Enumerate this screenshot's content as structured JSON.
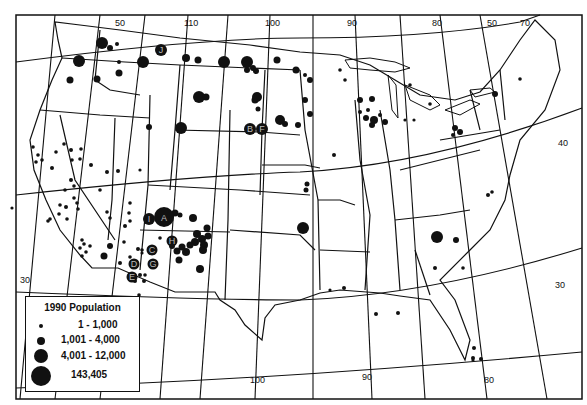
{
  "map": {
    "title": "",
    "graticule_labels": {
      "top": [
        "50",
        "110",
        "100",
        "90",
        "80",
        "50",
        "70"
      ],
      "bottom": [
        "100",
        "90",
        "80"
      ],
      "left": [
        "30"
      ],
      "right": [
        "40",
        "30"
      ]
    },
    "lat_lines": [
      "50",
      "40",
      "30"
    ],
    "lon_lines": [
      "120",
      "110",
      "100",
      "90",
      "80",
      "70"
    ],
    "lettered_sites": [
      "A",
      "B",
      "C",
      "D",
      "E",
      "F",
      "G",
      "H",
      "I",
      "J"
    ],
    "symbol_color": "#111111",
    "line_color": "#111111",
    "background": "#ffffff"
  },
  "legend": {
    "title": "1990 Population",
    "items": [
      {
        "label": "1 - 1,000",
        "size": 4
      },
      {
        "label": "1,001 - 4,000",
        "size": 8
      },
      {
        "label": "4,001 - 12,000",
        "size": 14
      },
      {
        "label": "143,405",
        "size": 20
      }
    ]
  }
}
